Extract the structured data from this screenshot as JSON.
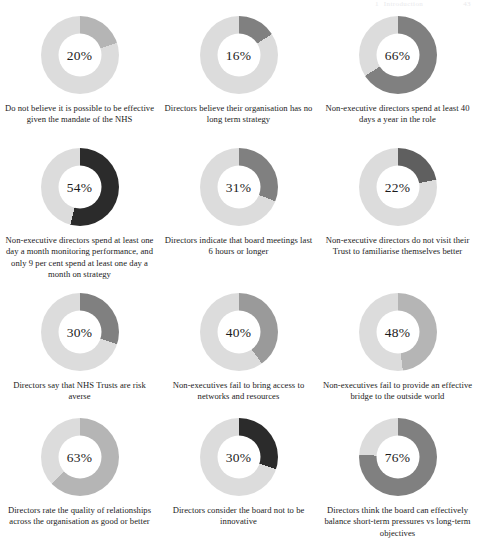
{
  "page": {
    "running_header": {
      "chapter_number": "1",
      "chapter_title": "Introduction",
      "folio": "43"
    }
  },
  "colors": {
    "track": "#dcdcdc",
    "light_gray": "#b5b5b5",
    "medium_gray": "#808080",
    "dark_charcoal": "#2b2b2b",
    "hole": "#ffffff",
    "text": "#1b1b1b",
    "page_background": "#ffffff"
  },
  "chart_data": {
    "type": "pie",
    "title": "",
    "subtitle": "",
    "xlabel": "",
    "ylabel": "",
    "legend_position": "none",
    "grid": false,
    "note": "Twelve single-value donut (ring) charts; each shows one percentage filled clockwise from 12 o'clock against a light grey remainder track.",
    "charts": [
      {
        "id": "chart-1",
        "value": 20,
        "value_label": "20%",
        "remainder": 80,
        "segment_color": "#b5b5b5",
        "track_color": "#dcdcdc",
        "caption": "Do not believe it is possible to be effective given the mandate of the NHS"
      },
      {
        "id": "chart-2",
        "value": 16,
        "value_label": "16%",
        "remainder": 84,
        "segment_color": "#808080",
        "track_color": "#dcdcdc",
        "caption": "Directors believe their organisation has no long term strategy"
      },
      {
        "id": "chart-3",
        "value": 66,
        "value_label": "66%",
        "remainder": 34,
        "segment_color": "#808080",
        "track_color": "#dcdcdc",
        "caption": "Non-executive directors spend at least 40 days a year in the role"
      },
      {
        "id": "chart-4",
        "value": 54,
        "value_label": "54%",
        "remainder": 46,
        "segment_color": "#2b2b2b",
        "track_color": "#dcdcdc",
        "caption": "Non-executive directors spend at least one day a month monitoring performance, and only 9 per cent spend at least one day a month on strategy"
      },
      {
        "id": "chart-5",
        "value": 31,
        "value_label": "31%",
        "remainder": 69,
        "segment_color": "#808080",
        "track_color": "#dcdcdc",
        "caption": "Directors indicate that board meetings last 6 hours or longer"
      },
      {
        "id": "chart-6",
        "value": 22,
        "value_label": "22%",
        "remainder": 78,
        "segment_color": "#5f5f5f",
        "track_color": "#dcdcdc",
        "caption": "Non-executive directors do not visit their Trust to familiarise themselves better"
      },
      {
        "id": "chart-7",
        "value": 30,
        "value_label": "30%",
        "remainder": 70,
        "segment_color": "#808080",
        "track_color": "#dcdcdc",
        "caption": "Directors say that NHS Trusts are risk averse"
      },
      {
        "id": "chart-8",
        "value": 40,
        "value_label": "40%",
        "remainder": 60,
        "segment_color": "#9a9a9a",
        "track_color": "#dcdcdc",
        "caption": "Non-executives fail to bring access to networks and resources"
      },
      {
        "id": "chart-9",
        "value": 48,
        "value_label": "48%",
        "remainder": 52,
        "segment_color": "#b5b5b5",
        "track_color": "#dcdcdc",
        "caption": "Non-executives fail to provide an effective bridge to the outside world"
      },
      {
        "id": "chart-10",
        "value": 63,
        "value_label": "63%",
        "remainder": 37,
        "segment_color": "#b5b5b5",
        "track_color": "#dcdcdc",
        "caption": "Directors rate the quality of relationships across the organisation as good or better"
      },
      {
        "id": "chart-11",
        "value": 30,
        "value_label": "30%",
        "remainder": 70,
        "segment_color": "#2b2b2b",
        "track_color": "#dcdcdc",
        "caption": "Directors consider the board not to be innovative"
      },
      {
        "id": "chart-12",
        "value": 76,
        "value_label": "76%",
        "remainder": 24,
        "segment_color": "#808080",
        "track_color": "#dcdcdc",
        "caption": "Directors think the board can effectively balance short-term pressures vs long-term objectives"
      }
    ]
  }
}
